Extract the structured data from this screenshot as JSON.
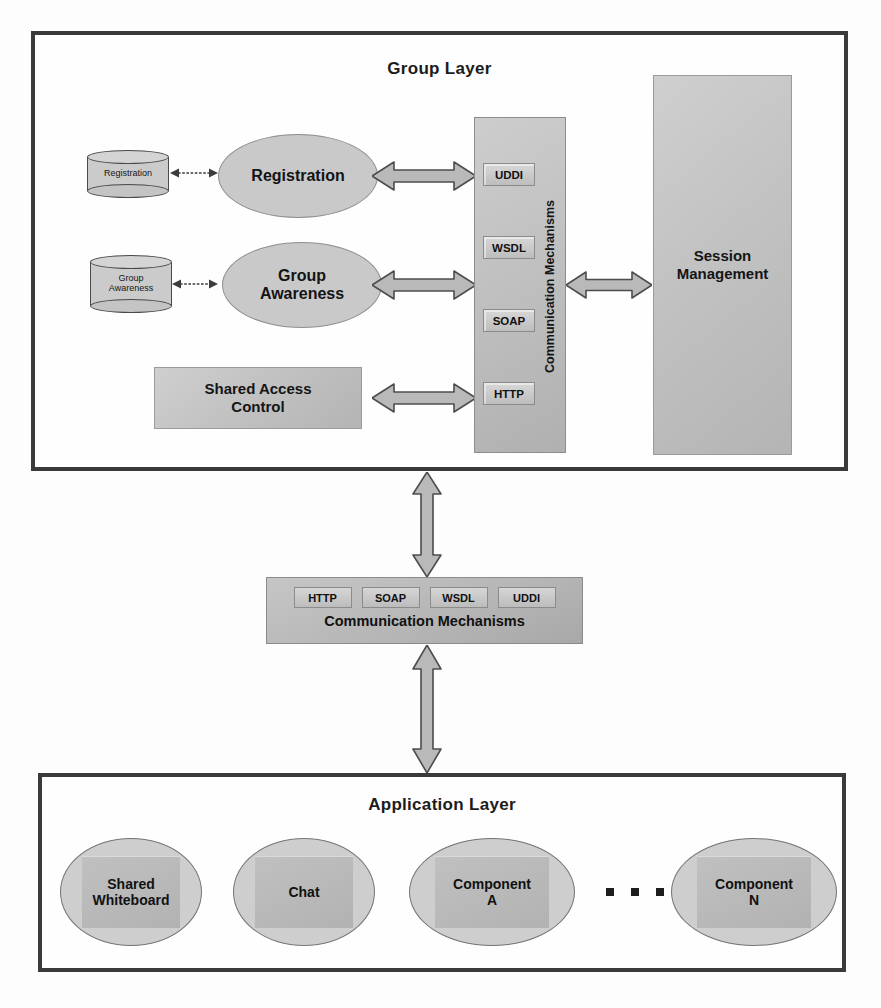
{
  "diagram": {
    "title_group_layer": "Group Layer",
    "title_application_layer": "Application Layer"
  },
  "group_layer": {
    "datastores": [
      {
        "id": "registration-store",
        "label": "Registration"
      },
      {
        "id": "group-awareness-store",
        "label": "Group\nAwareness"
      }
    ],
    "services": [
      {
        "id": "registration-service",
        "label": "Registration"
      },
      {
        "id": "group-awareness-service",
        "label": "Group\nAwareness"
      }
    ],
    "shared_access_control": "Shared Access\nControl",
    "session_management": "Session\nManagement",
    "comm_column": {
      "label": "Communication Mechanisms",
      "protocols": [
        "UDDI",
        "WSDL",
        "SOAP",
        "HTTP"
      ]
    }
  },
  "comm_bar": {
    "label": "Communication Mechanisms",
    "protocols": [
      "HTTP",
      "SOAP",
      "WSDL",
      "UDDI"
    ]
  },
  "application_layer": {
    "components": [
      {
        "id": "shared-whiteboard",
        "label": "Shared\nWhiteboard"
      },
      {
        "id": "chat",
        "label": "Chat"
      },
      {
        "id": "component-a",
        "label": "Component\nA"
      },
      {
        "id": "component-n",
        "label": "Component\nN"
      }
    ],
    "ellipsis": "..."
  },
  "colors": {
    "frame_border": "#3a3a3a",
    "shape_fill": "#c4c4c4",
    "shape_border": "#8f8f8f",
    "arrow_fill": "#b9b9b9",
    "arrow_stroke": "#4d4d4d",
    "text": "#141414",
    "background": "#fdfdfd"
  }
}
